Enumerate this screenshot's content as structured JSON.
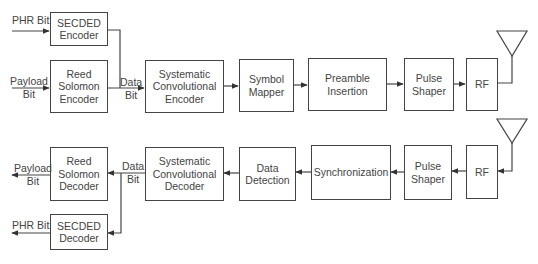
{
  "diagram": {
    "type": "block-diagram",
    "title": "",
    "transmitter": {
      "inputs": [
        {
          "id": "phr_in",
          "label": "PHR Bit"
        },
        {
          "id": "payload_in",
          "label": "Payload\nBit"
        }
      ],
      "blocks": [
        {
          "id": "secded_enc",
          "label": "SECDED\nEncoder"
        },
        {
          "id": "rs_enc",
          "label": "Reed\nSolomon\nEncoder"
        },
        {
          "id": "sc_enc",
          "label": "Systematic\nConvolutional\nEncoder"
        },
        {
          "id": "symbol_mapper",
          "label": "Symbol\nMapper"
        },
        {
          "id": "preamble",
          "label": "Preamble\nInsertion"
        },
        {
          "id": "pulse_tx",
          "label": "Pulse\nShaper"
        },
        {
          "id": "rf_tx",
          "label": "RF"
        }
      ],
      "data_bit_label": "Data\nBit"
    },
    "receiver": {
      "blocks": [
        {
          "id": "rf_rx",
          "label": "RF"
        },
        {
          "id": "pulse_rx",
          "label": "Pulse\nShaper"
        },
        {
          "id": "sync",
          "label": "Synchronization"
        },
        {
          "id": "data_det",
          "label": "Data\nDetection"
        },
        {
          "id": "sc_dec",
          "label": "Systematic\nConvolutional\nDecoder"
        },
        {
          "id": "rs_dec",
          "label": "Reed\nSolomon\nDecoder"
        },
        {
          "id": "secded_dec",
          "label": "SECDED\nDecoder"
        }
      ],
      "outputs": [
        {
          "id": "payload_out",
          "label": "Payload\nBit"
        },
        {
          "id": "phr_out",
          "label": "PHR Bit"
        }
      ],
      "data_bit_label": "Data\nBit"
    },
    "edges": [
      {
        "from": "phr_in",
        "to": "secded_enc"
      },
      {
        "from": "payload_in",
        "to": "rs_enc"
      },
      {
        "from": "secded_enc",
        "to": "sc_enc"
      },
      {
        "from": "rs_enc",
        "to": "sc_enc"
      },
      {
        "from": "sc_enc",
        "to": "symbol_mapper"
      },
      {
        "from": "symbol_mapper",
        "to": "preamble"
      },
      {
        "from": "preamble",
        "to": "pulse_tx"
      },
      {
        "from": "pulse_tx",
        "to": "rf_tx"
      },
      {
        "from": "rf_tx",
        "to": "antenna_tx"
      },
      {
        "from": "antenna_rx",
        "to": "rf_rx"
      },
      {
        "from": "rf_rx",
        "to": "pulse_rx"
      },
      {
        "from": "pulse_rx",
        "to": "sync"
      },
      {
        "from": "sync",
        "to": "data_det"
      },
      {
        "from": "data_det",
        "to": "sc_dec"
      },
      {
        "from": "sc_dec",
        "to": "rs_dec"
      },
      {
        "from": "sc_dec",
        "to": "secded_dec"
      },
      {
        "from": "rs_dec",
        "to": "payload_out"
      },
      {
        "from": "secded_dec",
        "to": "phr_out"
      }
    ],
    "antennas": [
      {
        "id": "antenna_tx",
        "icon": "antenna-icon"
      },
      {
        "id": "antenna_rx",
        "icon": "antenna-icon"
      }
    ]
  }
}
